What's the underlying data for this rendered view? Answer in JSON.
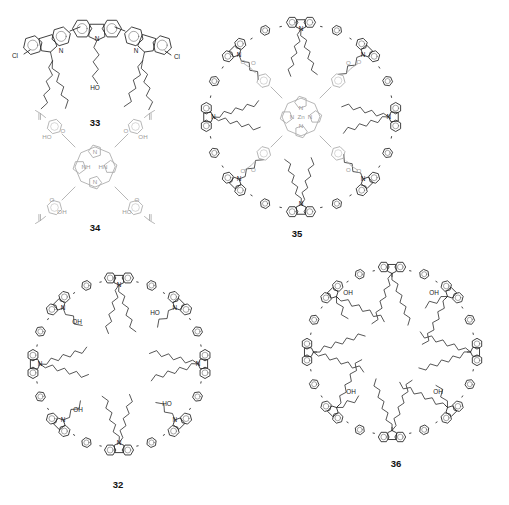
{
  "figure": {
    "kind": "chemical-structure-panel",
    "background_color": "#ffffff",
    "width": 509,
    "height": 505,
    "stroke_color": "#2b2b2b",
    "gray_stroke_color": "#a9a9a9"
  },
  "compounds": [
    {
      "id": "33",
      "label": "33",
      "label_x": 95,
      "label_y": 123,
      "name": "terCarbazole",
      "description": "Linear 2,7-linked tercarbazole bearing terminal chloro substituents, two branched N-alkyl chains and one central N-hydroxyalkyl chain",
      "atom_labels": [
        {
          "text": "Cl",
          "x": 15,
          "y": 56
        },
        {
          "text": "N",
          "x": 61,
          "y": 51
        },
        {
          "text": "N",
          "x": 97,
          "y": 39
        },
        {
          "text": "N",
          "x": 136,
          "y": 51
        },
        {
          "text": "Cl",
          "x": 177,
          "y": 57
        },
        {
          "text": "HO",
          "x": 95,
          "y": 88
        }
      ]
    },
    {
      "id": "34",
      "label": "34",
      "label_x": 95,
      "label_y": 228,
      "name": "tetrakis(4-carboxyphenyl)porphyrin",
      "description": "Free-base porphyrin with four meso 4-carboxyphenyl groups, drawn in light gray",
      "atom_labels": [
        {
          "text": "HO",
          "x": 47,
          "y": 137
        },
        {
          "text": "O",
          "x": 63,
          "y": 131
        },
        {
          "text": "O",
          "x": 126,
          "y": 131
        },
        {
          "text": "OH",
          "x": 143,
          "y": 137
        },
        {
          "text": "N",
          "x": 95,
          "y": 152
        },
        {
          "text": "NH",
          "x": 86,
          "y": 167
        },
        {
          "text": "HN",
          "x": 103,
          "y": 167
        },
        {
          "text": "N",
          "x": 95,
          "y": 182
        },
        {
          "text": "O",
          "x": 52,
          "y": 200
        },
        {
          "text": "OH",
          "x": 62,
          "y": 212
        },
        {
          "text": "O",
          "x": 137,
          "y": 200
        },
        {
          "text": "HO",
          "x": 127,
          "y": 212
        }
      ]
    },
    {
      "id": "35",
      "label": "35",
      "label_x": 297,
      "label_y": 234,
      "name": "carbazole macrocycle with zinc porphyrin core",
      "description": "Eight-carbazole macrocycle covalently tethered through four ester linkages to a central zinc tetraphenylporphyrin",
      "center": {
        "x": 301,
        "y": 117
      },
      "outer_radius": 113,
      "unit_count": 8,
      "core": {
        "metal": "Zn",
        "metal_x": 301,
        "metal_y": 117,
        "nitrogen_labels": [
          "N",
          "N",
          "N",
          "N"
        ],
        "ester_count": 4,
        "ester_atoms": [
          "O",
          "O"
        ]
      },
      "nitrogen_label": "N",
      "nitrogen_count": 8
    },
    {
      "id": "32",
      "label": "32",
      "label_x": 118,
      "label_y": 485,
      "name": "empty carbazole macrocycle",
      "description": "Eight-carbazole macrocycle with alternating branched alkyl and hydroxyalkyl N-substituents, no guest",
      "center": {
        "x": 119,
        "y": 364
      },
      "outer_radius": 105,
      "unit_count": 8,
      "nitrogen_label": "N",
      "nitrogen_count": 8,
      "hydroxyl_labels": [
        {
          "text": "OH",
          "x": 77,
          "y": 322
        },
        {
          "text": "HO",
          "x": 155,
          "y": 313
        },
        {
          "text": "OH",
          "x": 78,
          "y": 410
        },
        {
          "text": "HO",
          "x": 167,
          "y": 404
        }
      ]
    },
    {
      "id": "36",
      "label": "36",
      "label_x": 396,
      "label_y": 464,
      "name": "fluorene macrocycle",
      "description": "Eight-fluorene macrocycle with C9 quaternary centres each carrying one alkyl and one hydroxyalkyl chain",
      "center": {
        "x": 392,
        "y": 352
      },
      "outer_radius": 104,
      "unit_count": 8,
      "hydroxyl_labels": [
        {
          "text": "OH",
          "x": 348,
          "y": 293
        },
        {
          "text": "OH",
          "x": 434,
          "y": 293
        },
        {
          "text": "OH",
          "x": 351,
          "y": 392
        },
        {
          "text": "OH",
          "x": 438,
          "y": 392
        }
      ]
    }
  ]
}
